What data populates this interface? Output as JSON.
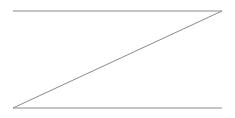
{
  "figure": {
    "name": "z-shape-line-drawing",
    "background_color": "#ffffff",
    "stroke_color": "#8a8a8a",
    "stroke_width": 1,
    "canvas": {
      "width": 235,
      "height": 118
    },
    "vertices": {
      "top_left": {
        "x": 13,
        "y": 11
      },
      "top_right": {
        "x": 222,
        "y": 11
      },
      "bottom_left": {
        "x": 13,
        "y": 108
      },
      "bottom_right": {
        "x": 222,
        "y": 108
      }
    },
    "segments": [
      {
        "name": "top-horizontal-line",
        "label": "Top horizontal line",
        "x1": 13,
        "y1": 11,
        "x2": 222,
        "y2": 11
      },
      {
        "name": "diagonal-line",
        "label": "Diagonal line",
        "x1": 222,
        "y1": 11,
        "x2": 13,
        "y2": 108
      },
      {
        "name": "bottom-horizontal-line",
        "label": "Bottom horizontal line",
        "x1": 13,
        "y1": 108,
        "x2": 222,
        "y2": 108
      }
    ],
    "path_d": "M 13 11 L 222 11 L 13 108 L 222 108"
  }
}
